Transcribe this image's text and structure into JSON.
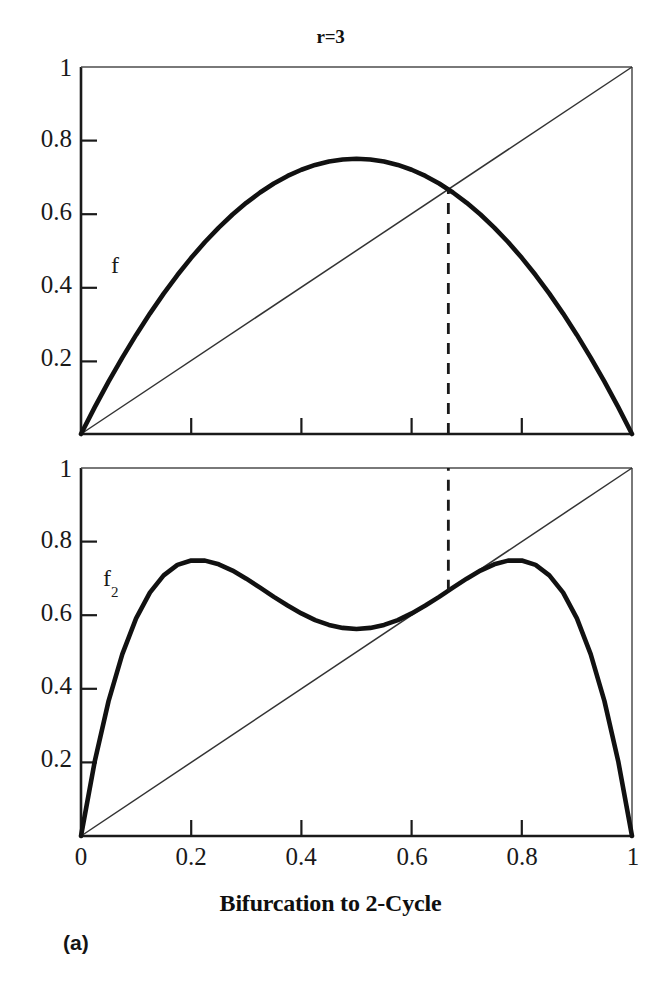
{
  "figure": {
    "title": "r=3",
    "xaxis_title": "Bifurcation to 2-Cycle",
    "panel_label": "(a)",
    "caption_fragment": ""
  },
  "labels": {
    "curve_f": "f",
    "curve_f2_base": "f",
    "curve_f2_sub": "2"
  },
  "ticks": {
    "y": [
      "1",
      "0.8",
      "0.6",
      "0.4",
      "0.2"
    ],
    "x": [
      "0",
      "0.2",
      "0.4",
      "0.6",
      "0.8",
      "1"
    ]
  },
  "colors": {
    "curve": "#111111",
    "diagonal": "#333333",
    "axis": "#1a1a1a",
    "dashed": "#1a1a1a",
    "background": "#ffffff"
  },
  "chart_data": [
    {
      "type": "line",
      "title": "r=3",
      "name": "logistic-map-f",
      "xlabel": "",
      "ylabel": "f",
      "xlim": [
        0,
        1
      ],
      "ylim": [
        0,
        1
      ],
      "grid": false,
      "legend": "none",
      "r_parameter": 3,
      "equation": "f(x) = 3x(1-x)",
      "series": [
        {
          "name": "f",
          "linewidth": "thick",
          "x": [
            0,
            0.025,
            0.05,
            0.075,
            0.1,
            0.125,
            0.15,
            0.175,
            0.2,
            0.225,
            0.25,
            0.275,
            0.3,
            0.325,
            0.35,
            0.375,
            0.4,
            0.425,
            0.45,
            0.475,
            0.5,
            0.525,
            0.55,
            0.575,
            0.6,
            0.625,
            0.65,
            0.675,
            0.7,
            0.725,
            0.75,
            0.775,
            0.8,
            0.825,
            0.85,
            0.875,
            0.9,
            0.925,
            0.95,
            0.975,
            1
          ],
          "y": [
            0,
            0.0731,
            0.1425,
            0.2081,
            0.27,
            0.3281,
            0.3825,
            0.4331,
            0.48,
            0.5231,
            0.5625,
            0.5981,
            0.63,
            0.6581,
            0.6825,
            0.7031,
            0.72,
            0.7331,
            0.7425,
            0.7481,
            0.75,
            0.7481,
            0.7425,
            0.7331,
            0.72,
            0.7031,
            0.6825,
            0.6581,
            0.63,
            0.5981,
            0.5625,
            0.5231,
            0.48,
            0.4331,
            0.3825,
            0.3281,
            0.27,
            0.2081,
            0.1425,
            0.0731,
            0
          ]
        },
        {
          "name": "diagonal y=x",
          "linewidth": "thin",
          "x": [
            0,
            1
          ],
          "y": [
            0,
            1
          ]
        }
      ],
      "annotations": [
        {
          "type": "vertical-dashed-line",
          "x": 0.6667,
          "y_from": 0,
          "y_to": 0.6667,
          "meaning": "fixed point x* = 1 - 1/r"
        }
      ]
    },
    {
      "type": "line",
      "title": "",
      "name": "logistic-map-f2",
      "xlabel": "Bifurcation to 2-Cycle",
      "ylabel": "f_2",
      "xlim": [
        0,
        1
      ],
      "ylim": [
        0,
        1
      ],
      "grid": false,
      "legend": "none",
      "r_parameter": 3,
      "equation": "f2(x) = f(f(x)), f(x) = 3x(1-x)",
      "series": [
        {
          "name": "f_2",
          "linewidth": "thick",
          "x": [
            0,
            0.025,
            0.05,
            0.075,
            0.1,
            0.125,
            0.15,
            0.175,
            0.2,
            0.225,
            0.25,
            0.275,
            0.3,
            0.325,
            0.35,
            0.375,
            0.4,
            0.425,
            0.45,
            0.475,
            0.5,
            0.525,
            0.55,
            0.575,
            0.6,
            0.625,
            0.65,
            0.675,
            0.7,
            0.725,
            0.75,
            0.775,
            0.8,
            0.825,
            0.85,
            0.875,
            0.9,
            0.925,
            0.95,
            0.975,
            1
          ],
          "y": [
            0,
            0.2033,
            0.3665,
            0.4943,
            0.5913,
            0.6613,
            0.7081,
            0.7366,
            0.7488,
            0.7483,
            0.7383,
            0.7213,
            0.6993,
            0.6749,
            0.6499,
            0.6264,
            0.6048,
            0.5866,
            0.5736,
            0.5655,
            0.5625,
            0.5655,
            0.5736,
            0.5866,
            0.6048,
            0.6264,
            0.6499,
            0.6749,
            0.6993,
            0.7213,
            0.7383,
            0.7483,
            0.7488,
            0.7366,
            0.7081,
            0.6613,
            0.5913,
            0.4943,
            0.3665,
            0.2033,
            0
          ]
        },
        {
          "name": "diagonal y=x",
          "linewidth": "thin",
          "x": [
            0,
            1
          ],
          "y": [
            0,
            1
          ]
        }
      ],
      "annotations": [
        {
          "type": "vertical-dashed-line",
          "x": 0.6667,
          "y_from": 0.6667,
          "y_to": 1.0,
          "meaning": "tangency of f2 with diagonal at the bifurcation point"
        }
      ]
    }
  ]
}
